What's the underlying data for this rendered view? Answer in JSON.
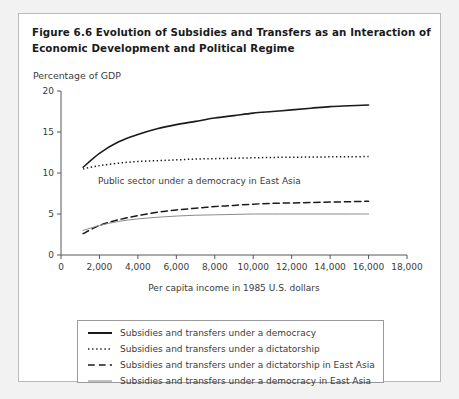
{
  "figure": {
    "title_line1": "Figure 6.6  Evolution of Subsidies and Transfers as an Interaction of",
    "title_line2": "Economic Development and Political Regime",
    "unit_label": "Percentage of GDP"
  },
  "colors": {
    "panel_border": "#b9b9bb",
    "axis": "#555759",
    "text": "#3b3b3b",
    "series_democracy": "#1a1a1a",
    "series_dictatorship": "#1a1a1a",
    "series_dictatorship_ea": "#1a1a1a",
    "series_democracy_ea": "#8a8a8c",
    "background": "#ffffff",
    "outer_background": "#f2f2f2"
  },
  "chart_data": {
    "type": "line",
    "title": "Figure 6.6  Evolution of Subsidies and Transfers as an Interaction of Economic Development and Political Regime",
    "xlabel": "Per capita income in 1985 U.S. dollars",
    "ylabel": "Percentage of GDP",
    "xlim": [
      0,
      18000
    ],
    "ylim": [
      0,
      20
    ],
    "xticks": [
      0,
      2000,
      4000,
      6000,
      8000,
      10000,
      12000,
      14000,
      16000,
      18000
    ],
    "xtick_labels": [
      "0",
      "2,000",
      "4,000",
      "6,000",
      "8,000",
      "10,000",
      "12,000",
      "14,000",
      "16,000",
      "18,000"
    ],
    "yticks": [
      0,
      5,
      10,
      15,
      20
    ],
    "ytick_labels": [
      "0",
      "5",
      "10",
      "15",
      "20"
    ],
    "grid": false,
    "legend_position": "below-axes",
    "annotations": [
      {
        "text": "Public sector under a democracy in East Asia",
        "x": 7200,
        "y": 8.6
      }
    ],
    "x": [
      1150,
      2000,
      3000,
      4000,
      5000,
      6000,
      7000,
      8000,
      9000,
      10000,
      11000,
      12000,
      13000,
      14000,
      15000,
      16000
    ],
    "series": [
      {
        "name": "Subsidies and transfers under a democracy",
        "style": "solid",
        "width": 1.6,
        "color": "#1a1a1a",
        "values": [
          10.7,
          12.4,
          13.8,
          14.7,
          15.4,
          15.9,
          16.3,
          16.7,
          17.0,
          17.3,
          17.5,
          17.7,
          17.9,
          18.1,
          18.2,
          18.3
        ]
      },
      {
        "name": "Subsidies and transfers under a dictatorship",
        "style": "dotted",
        "width": 1.5,
        "color": "#1a1a1a",
        "values": [
          10.5,
          10.9,
          11.2,
          11.4,
          11.5,
          11.6,
          11.7,
          11.75,
          11.8,
          11.85,
          11.9,
          11.92,
          11.95,
          11.97,
          11.99,
          12.0
        ]
      },
      {
        "name": "Subsidies and transfers under a dictatorship in East Asia",
        "style": "dashed",
        "width": 1.5,
        "color": "#1a1a1a",
        "values": [
          2.6,
          3.6,
          4.3,
          4.8,
          5.2,
          5.5,
          5.7,
          5.9,
          6.05,
          6.2,
          6.3,
          6.35,
          6.4,
          6.45,
          6.5,
          6.55
        ]
      },
      {
        "name": "Subsidies and transfers under a democracy in East Asia",
        "style": "solid",
        "width": 1.0,
        "color": "#8a8a8c",
        "values": [
          3.0,
          3.6,
          4.1,
          4.4,
          4.6,
          4.75,
          4.85,
          4.9,
          4.95,
          5.0,
          5.0,
          5.0,
          5.0,
          5.0,
          5.0,
          5.0
        ]
      }
    ]
  },
  "legend": {
    "items": [
      {
        "label": "Subsidies and transfers under a democracy",
        "style": "solid",
        "width": 2.0,
        "color": "#1a1a1a"
      },
      {
        "label": "Subsidies and transfers under a dictatorship",
        "style": "dotted",
        "width": 1.6,
        "color": "#1a1a1a"
      },
      {
        "label": "Subsidies and transfers under a dictatorship in East Asia",
        "style": "dashed",
        "width": 1.6,
        "color": "#1a1a1a"
      },
      {
        "label": "Subsidies and transfers under a democracy in East Asia",
        "style": "solid",
        "width": 1.1,
        "color": "#8a8a8c"
      }
    ]
  }
}
